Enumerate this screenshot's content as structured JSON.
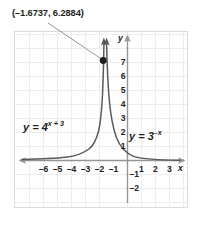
{
  "chart_data": {
    "type": "line",
    "title": "",
    "xlabel": "x",
    "ylabel": "y",
    "xlim": [
      -7,
      4
    ],
    "ylim": [
      -2.6,
      7.8
    ],
    "grid": true,
    "legend_position": "inline-annotations",
    "xticks": [
      -6,
      -5,
      -4,
      -3,
      -2,
      -1,
      1,
      2,
      3
    ],
    "xtick_labels": [
      "–6",
      "–5",
      "–4",
      "–3",
      "–2",
      "–1",
      "1",
      "2",
      "3"
    ],
    "yticks": [
      7,
      6,
      5,
      4,
      3,
      2,
      1,
      -1,
      -2
    ],
    "ytick_labels": [
      "7",
      "6",
      "5",
      "4",
      "3",
      "2",
      "1",
      "–1",
      "–2"
    ],
    "series": [
      {
        "name": "y = 4^(x+3)",
        "equation_display": "y = 4",
        "exponent_display": "x + 3",
        "color": "#58595b",
        "arrow_end": "top"
      },
      {
        "name": "y = 3^(-x)",
        "equation_display": "y = 3",
        "exponent_display": "–x",
        "color": "#58595b",
        "arrow_end": "top"
      }
    ],
    "annotations": [
      {
        "name": "intersection-point",
        "label": "(–1.6737, 6.2884)",
        "x": -1.6737,
        "y": 6.2884,
        "marker": "filled-circle",
        "leader_line": true
      }
    ]
  },
  "axes": {
    "x_axis_name": "x",
    "y_axis_name": "y"
  },
  "colors": {
    "curve": "#58595b",
    "axis": "#939598",
    "grid": "#ededee",
    "frame": "#d9d9da",
    "text": "#231f20",
    "leader": "#939598",
    "point": "#231f20"
  }
}
